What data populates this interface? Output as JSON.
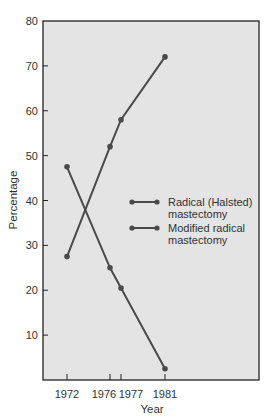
{
  "chart_data": {
    "type": "line",
    "title": "",
    "xlabel": "Year",
    "ylabel": "Percentage",
    "x": [
      1972,
      1976,
      1977,
      1981
    ],
    "x_tick_labels": [
      "1972",
      "1976",
      "1977",
      "1981"
    ],
    "y_ticks": [
      10,
      20,
      30,
      40,
      50,
      60,
      70,
      80
    ],
    "ylim": [
      0,
      80
    ],
    "grid": false,
    "legend_position": "right-middle",
    "series": [
      {
        "name": "Radical (Halsted) mastectomy",
        "legend_lines": [
          "Radical (Halsted)",
          "mastectomy"
        ],
        "values": [
          47.5,
          25,
          20.5,
          2.5
        ]
      },
      {
        "name": "Modified radical mastectomy",
        "legend_lines": [
          "Modified radical",
          "mastectomy"
        ],
        "values": [
          27.5,
          52,
          58,
          72
        ]
      }
    ],
    "colors": {
      "plot_background": "#e4e4e4",
      "line": "#4a4a4a",
      "axis": "#222222"
    }
  }
}
